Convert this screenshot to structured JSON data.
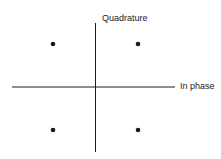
{
  "diagram": {
    "type": "constellation",
    "labels": {
      "vertical_axis": "Quadrature",
      "horizontal_axis": "In phase"
    },
    "points": [
      {
        "name": "upper-left",
        "i": -1,
        "q": 1
      },
      {
        "name": "upper-right",
        "i": 1,
        "q": 1
      },
      {
        "name": "lower-left",
        "i": -1,
        "q": -1
      },
      {
        "name": "lower-right",
        "i": 1,
        "q": -1
      }
    ],
    "colors": {
      "ink": "#1a1a1a",
      "background": "#ffffff"
    }
  }
}
